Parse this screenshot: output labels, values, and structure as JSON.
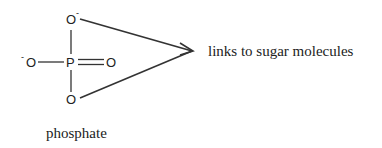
{
  "diagram": {
    "title": "phosphate",
    "atoms": {
      "phosphorus": "P",
      "oxygen_top": "O",
      "oxygen_left": "O",
      "oxygen_right": "O",
      "oxygen_bottom": "O"
    },
    "charges": {
      "top": "-",
      "left": "-"
    },
    "arrow_label": "links to sugar molecules",
    "caption": "phosphate"
  }
}
